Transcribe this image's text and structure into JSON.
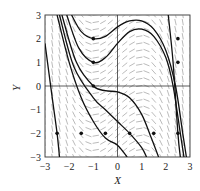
{
  "chart_data": {
    "type": "line",
    "subtype": "slope-field-with-solution-curves",
    "title": "",
    "xlabel": "X",
    "ylabel": "Y",
    "xlim": [
      -3,
      3
    ],
    "ylim": [
      -3,
      3
    ],
    "x_ticks": [
      "-3",
      "-2",
      "-1",
      "0",
      "1",
      "2",
      "3"
    ],
    "y_ticks": [
      "3",
      "2",
      "1",
      "0",
      "-1",
      "-2",
      "-3"
    ],
    "grid": false,
    "axes_through_origin": true,
    "initial_points": [
      {
        "x": -1,
        "y": 2
      },
      {
        "x": -1,
        "y": 1
      },
      {
        "x": -1,
        "y": 0
      },
      {
        "x": 2.5,
        "y": 2
      },
      {
        "x": 2.5,
        "y": 1
      },
      {
        "x": -2.5,
        "y": -2
      },
      {
        "x": -1.5,
        "y": -2
      },
      {
        "x": -0.5,
        "y": -2
      },
      {
        "x": 0.5,
        "y": -2
      },
      {
        "x": 1.5,
        "y": -2
      },
      {
        "x": 2.5,
        "y": -2
      }
    ],
    "series": [
      {
        "name": "solution through (-1,2)",
        "points": [
          [
            -1.9,
            3
          ],
          [
            -1.5,
            2.3
          ],
          [
            -1,
            2
          ],
          [
            -0.5,
            2.1
          ],
          [
            0,
            2.5
          ],
          [
            0.5,
            2.75
          ],
          [
            1,
            2.75
          ],
          [
            1.5,
            2.4
          ],
          [
            2,
            1.5
          ],
          [
            2.4,
            0
          ],
          [
            2.7,
            -2
          ],
          [
            2.85,
            -3
          ]
        ]
      },
      {
        "name": "solution through (-1,1)",
        "points": [
          [
            -2.1,
            3
          ],
          [
            -1.6,
            1.6
          ],
          [
            -1,
            1
          ],
          [
            -0.5,
            1.2
          ],
          [
            0,
            1.8
          ],
          [
            0.5,
            2.3
          ],
          [
            1,
            2.4
          ],
          [
            1.5,
            2.1
          ],
          [
            2,
            1.2
          ],
          [
            2.3,
            0
          ],
          [
            2.6,
            -2
          ],
          [
            2.75,
            -3
          ]
        ]
      },
      {
        "name": "solution through (-1,0)",
        "points": [
          [
            -2.3,
            3
          ],
          [
            -1.7,
            1
          ],
          [
            -1,
            0
          ],
          [
            -0.5,
            -0.2
          ],
          [
            0,
            -0.25
          ],
          [
            0.5,
            -0.5
          ],
          [
            1,
            -1.2
          ],
          [
            1.4,
            -2.2
          ],
          [
            1.7,
            -3
          ]
        ]
      },
      {
        "name": "solution through (-2.5,-2)",
        "points": [
          [
            -3,
            1.8
          ],
          [
            -2.7,
            -0.5
          ],
          [
            -2.5,
            -2
          ],
          [
            -2.4,
            -3
          ]
        ]
      },
      {
        "name": "solution through (-1.5,-2)",
        "points": [
          [
            -2.5,
            3
          ],
          [
            -2,
            1
          ],
          [
            -1.5,
            -0.5
          ],
          [
            -1,
            -1.5
          ],
          [
            -0.5,
            -2.2
          ],
          [
            0,
            -2.5
          ],
          [
            0.4,
            -3
          ]
        ]
      },
      {
        "name": "solution through (0.5,-2)",
        "points": [
          [
            -2.4,
            3
          ],
          [
            -1.8,
            0.8
          ],
          [
            -1,
            -0.5
          ],
          [
            -0.5,
            -1
          ],
          [
            0,
            -1.5
          ],
          [
            0.5,
            -2
          ],
          [
            1,
            -2.6
          ],
          [
            1.2,
            -3
          ]
        ]
      },
      {
        "name": "solution through (2.5,-2)",
        "points": [
          [
            2.1,
            3
          ],
          [
            2.3,
            1
          ],
          [
            2.5,
            -2
          ],
          [
            2.6,
            -3
          ]
        ]
      }
    ]
  }
}
